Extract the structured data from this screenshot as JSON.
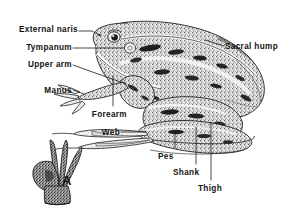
{
  "figure": {
    "inset_label": "A",
    "inset_caption": "manus (hand) detail",
    "background_color": "#ffffff",
    "ink_color": "#3a3a3a",
    "label_color": "#111111"
  },
  "labels": [
    {
      "id": "external-naris",
      "text": "External naris",
      "align": "right",
      "x": 78,
      "y": 25
    },
    {
      "id": "tympanum",
      "text": "Tympanum",
      "align": "right",
      "x": 72,
      "y": 43
    },
    {
      "id": "upper-arm",
      "text": "Upper arm",
      "align": "right",
      "x": 72,
      "y": 60
    },
    {
      "id": "manus",
      "text": "Manus",
      "align": "right",
      "x": 72,
      "y": 86
    },
    {
      "id": "forearm",
      "text": "Forearm",
      "align": "right",
      "x": 127,
      "y": 110
    },
    {
      "id": "web",
      "text": "Web",
      "align": "right",
      "x": 120,
      "y": 128
    },
    {
      "id": "sacral-hump",
      "text": "Sacral hump",
      "align": "left",
      "x": 225,
      "y": 42
    },
    {
      "id": "pes",
      "text": "Pes",
      "align": "left",
      "x": 158,
      "y": 152
    },
    {
      "id": "shank",
      "text": "Shank",
      "align": "left",
      "x": 173,
      "y": 168
    },
    {
      "id": "thigh",
      "text": "Thigh",
      "align": "left",
      "x": 198,
      "y": 184
    },
    {
      "id": "inset-a",
      "text": "A",
      "align": "left",
      "x": 62,
      "y": 176
    }
  ]
}
